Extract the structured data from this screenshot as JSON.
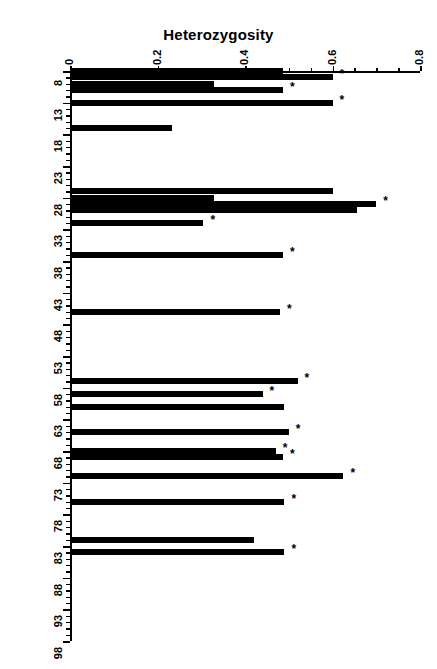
{
  "chart_data": {
    "type": "bar",
    "orientation": "horizontal",
    "title": "Heterozygosity",
    "xlabel": "Heterozygosity",
    "ylabel": "Amino acid\nposition",
    "xlim": [
      0,
      0.8
    ],
    "xticks": [
      0,
      0.2,
      0.4,
      0.6,
      0.8
    ],
    "xtick_labels": [
      "0",
      "0.2",
      "0.4",
      "0.6",
      "0.8"
    ],
    "xminor_step": 0.05,
    "ylim": [
      8,
      98
    ],
    "yticks": [
      8,
      13,
      18,
      23,
      28,
      33,
      38,
      43,
      48,
      53,
      58,
      63,
      68,
      73,
      78,
      83,
      88,
      93,
      98
    ],
    "ytick_labels": [
      "8",
      "13",
      "18",
      "23",
      "28",
      "33",
      "38",
      "43",
      "48",
      "53",
      "58",
      "63",
      "68",
      "73",
      "78",
      "83",
      "88",
      "93",
      "98"
    ],
    "yminor_step": 1,
    "grid": false,
    "legend": null,
    "bar_color": "#000000",
    "annotation_symbol": "*",
    "annotation_note": "Asterisk marks significant positions",
    "categories": [
      8,
      9,
      10,
      11,
      13,
      17,
      27,
      28,
      29,
      30,
      32,
      37,
      46,
      57,
      59,
      61,
      65,
      68,
      69,
      72,
      76,
      82,
      84
    ],
    "values": [
      0.487,
      0.6,
      0.33,
      0.487,
      0.6,
      0.232,
      0.6,
      0.33,
      0.7,
      0.655,
      0.305,
      0.487,
      0.48,
      0.52,
      0.44,
      0.49,
      0.5,
      0.47,
      0.487,
      0.625,
      0.49,
      0.42,
      0.49
    ],
    "starred": [
      false,
      true,
      false,
      true,
      true,
      false,
      false,
      false,
      true,
      true,
      true,
      true,
      true,
      true,
      true,
      false,
      true,
      true,
      true,
      true,
      true,
      false,
      true
    ],
    "bars": [
      {
        "position": 8,
        "value": 0.487,
        "star": false
      },
      {
        "position": 9,
        "value": 0.6,
        "star": true
      },
      {
        "position": 10,
        "value": 0.33,
        "star": false
      },
      {
        "position": 11,
        "value": 0.487,
        "star": true
      },
      {
        "position": 13,
        "value": 0.6,
        "star": true
      },
      {
        "position": 17,
        "value": 0.232,
        "star": false
      },
      {
        "position": 27,
        "value": 0.6,
        "star": false
      },
      {
        "position": 28,
        "value": 0.33,
        "star": false
      },
      {
        "position": 29,
        "value": 0.7,
        "star": true
      },
      {
        "position": 30,
        "value": 0.655,
        "star": true
      },
      {
        "position": 32,
        "value": 0.305,
        "star": true
      },
      {
        "position": 37,
        "value": 0.487,
        "star": true
      },
      {
        "position": 46,
        "value": 0.48,
        "star": true
      },
      {
        "position": 57,
        "value": 0.52,
        "star": true
      },
      {
        "position": 59,
        "value": 0.44,
        "star": true
      },
      {
        "position": 61,
        "value": 0.49,
        "star": false
      },
      {
        "position": 65,
        "value": 0.5,
        "star": true
      },
      {
        "position": 68,
        "value": 0.47,
        "star": true
      },
      {
        "position": 69,
        "value": 0.487,
        "star": true
      },
      {
        "position": 72,
        "value": 0.625,
        "star": true
      },
      {
        "position": 76,
        "value": 0.49,
        "star": true
      },
      {
        "position": 82,
        "value": 0.42,
        "star": false
      },
      {
        "position": 84,
        "value": 0.49,
        "star": true
      }
    ]
  }
}
